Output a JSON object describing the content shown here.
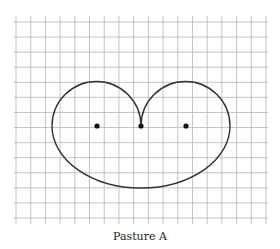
{
  "figure": {
    "caption": "Pasture A",
    "grid": {
      "columns": 17,
      "rows": 13,
      "color": "#b5b5b5"
    },
    "shape": {
      "type": "heart-shaped curve formed by two semicircular top lobes and a large lower arc",
      "stroke": "#333333"
    },
    "points": [
      {
        "name": "left-focus"
      },
      {
        "name": "center-cusp"
      },
      {
        "name": "right-focus"
      }
    ]
  }
}
